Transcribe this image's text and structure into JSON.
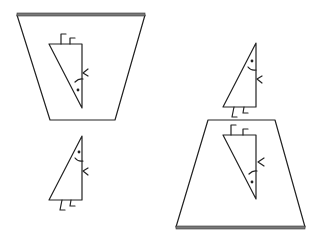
{
  "figure": {
    "colors": {
      "line": "#222222",
      "background": "#ffffff",
      "mirror_edge": "#7a7a7a"
    },
    "panels": [
      {
        "id": "left-mirror",
        "orientation": "overhead",
        "edge_position": "top",
        "reflected_figure": "inverted-triangle-character"
      },
      {
        "id": "right-mirror",
        "orientation": "floor",
        "edge_position": "bottom",
        "reflected_figure": "inverted-triangle-character"
      }
    ],
    "characters": [
      {
        "id": "left-standing-character",
        "features": [
          "eye",
          "smile",
          "hand",
          "two-legs"
        ]
      },
      {
        "id": "right-standing-character",
        "features": [
          "eye",
          "smile",
          "hand",
          "two-legs"
        ]
      }
    ]
  }
}
